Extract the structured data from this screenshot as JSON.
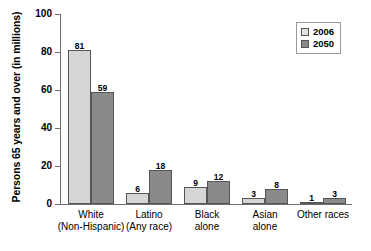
{
  "chart_data": {
    "type": "bar",
    "title": "",
    "xlabel": "",
    "ylabel": "Persons 65 years and over (in millions)",
    "categories": [
      {
        "line1": "White",
        "line2": "(Non-Hispanic)"
      },
      {
        "line1": "Latino",
        "line2": "(Any race)"
      },
      {
        "line1": "Black",
        "line2": "alone"
      },
      {
        "line1": "Asian",
        "line2": "alone"
      },
      {
        "line1": "Other races",
        "line2": ""
      }
    ],
    "series": [
      {
        "name": "2006",
        "color": "#d6d6d6",
        "values": [
          81,
          6,
          9,
          3,
          1
        ]
      },
      {
        "name": "2050",
        "color": "#8a8a8a",
        "values": [
          59,
          18,
          12,
          8,
          3
        ]
      }
    ],
    "ylim": [
      0,
      100
    ],
    "yticks": [
      0,
      20,
      40,
      60,
      80,
      100
    ],
    "ytick_labels": [
      "0",
      "20",
      "40",
      "60",
      "80",
      "100"
    ],
    "grid": false,
    "legend_position": "top-right",
    "legend_entries": [
      "2006",
      "2050"
    ]
  }
}
